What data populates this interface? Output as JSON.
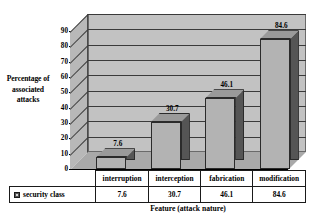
{
  "chart_data": {
    "type": "bar",
    "title": "",
    "categories": [
      "interruption",
      "interception",
      "fabrication",
      "modification"
    ],
    "values": [
      7.6,
      30.7,
      46.1,
      84.6
    ],
    "series": [
      {
        "name": "security class",
        "values": [
          7.6,
          30.7,
          46.1,
          84.6
        ]
      }
    ],
    "data_labels": [
      "7.6",
      "30.7",
      "46.1",
      "84.6"
    ],
    "xlabel": "Feature (attack nature)",
    "ylabel": "Percentage of associated attacks",
    "ylim": [
      0,
      90
    ],
    "yticks": [
      0,
      10,
      20,
      30,
      40,
      50,
      60,
      70,
      80,
      90
    ],
    "ytick_labels": [
      "0",
      "10",
      "20",
      "30",
      "40",
      "50",
      "60",
      "70",
      "80",
      "90"
    ],
    "grid": true,
    "legend_position": "bottom-table",
    "style": "3d-column",
    "colors": {
      "bar_front": "#b3b3b3",
      "bar_side": "#555555",
      "bar_top": "#9a9a9a",
      "plot_background": "#c2c2c2",
      "floor": "#a9a9a9",
      "gridline": "#3a3a3a",
      "text": "#000000",
      "border": "#1a1a1a"
    }
  },
  "axes": {
    "y_title_lines": [
      "Percentage of",
      "associated",
      "attacks"
    ],
    "x_title": "Feature (attack nature)"
  },
  "legend": {
    "series_label": "security class",
    "swatch_name": "security-class-swatch"
  },
  "table": {
    "category_row": [
      "interruption",
      "interception",
      "fabrication",
      "modification"
    ],
    "value_row_label": "security class",
    "value_row": [
      "7.6",
      "30.7",
      "46.1",
      "84.6"
    ]
  }
}
